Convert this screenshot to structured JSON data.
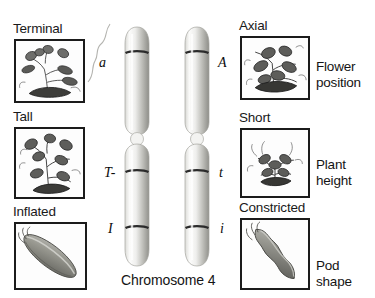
{
  "figure": {
    "caption": "Chromosome 4",
    "chromosome_count": 2
  },
  "left_column": {
    "traits": [
      {
        "phenotype_label": "Terminal",
        "image_name": "terminal-flower-illustration"
      },
      {
        "phenotype_label": "Tall",
        "image_name": "tall-plant-illustration"
      },
      {
        "phenotype_label": "Inflated",
        "image_name": "inflated-pod-illustration"
      }
    ]
  },
  "right_column": {
    "traits": [
      {
        "phenotype_label": "Axial",
        "image_name": "axial-flower-illustration"
      },
      {
        "phenotype_label": "Short",
        "image_name": "short-plant-illustration"
      },
      {
        "phenotype_label": "Constricted",
        "image_name": "constricted-pod-illustration"
      }
    ]
  },
  "trait_descriptors": [
    {
      "line1": "Flower",
      "line2": "position"
    },
    {
      "line1": "Plant",
      "line2": "height"
    },
    {
      "line1": "Pod",
      "line2": "shape"
    }
  ],
  "alleles": {
    "left_chromosome": [
      "a",
      "T-",
      "I"
    ],
    "right_chromosome": [
      "A",
      "t",
      "i"
    ]
  },
  "colors": {
    "ink": "#1b1b1b",
    "chromosome_band": "#2a2a2a",
    "chromosome_body_light": "#f2f2f0",
    "chromosome_body_mid": "#c9c9c5",
    "chromosome_body_dark": "#8e8e8a",
    "pod_fill": "#8d8d88",
    "background": "#ffffff"
  }
}
